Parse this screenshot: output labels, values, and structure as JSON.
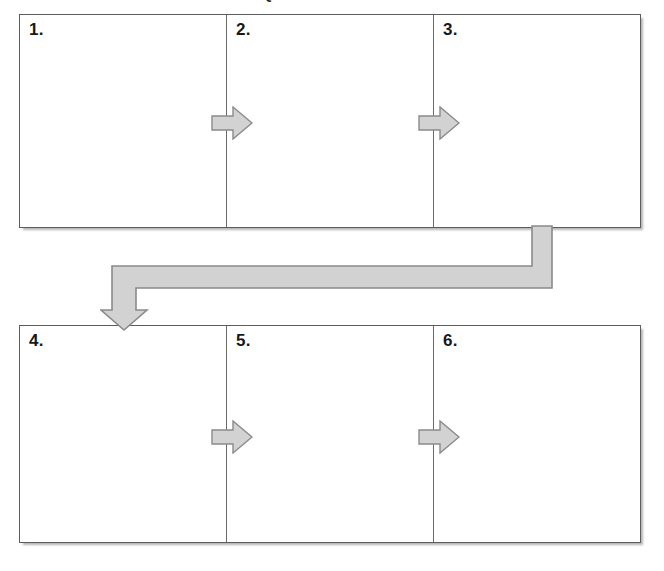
{
  "title": "SEQUENCE OF EVENTS",
  "colors": {
    "arrow_fill": "#d2d2d2",
    "arrow_stroke": "#8a8a8a",
    "box_border": "#5d5d5d",
    "divider": "#6a6a6a",
    "text": "#18181c",
    "background": "#ffffff"
  },
  "rows": [
    {
      "id": "row-top",
      "cells": [
        {
          "number": "1."
        },
        {
          "number": "2."
        },
        {
          "number": "3."
        }
      ]
    },
    {
      "id": "row-bottom",
      "cells": [
        {
          "number": "4."
        },
        {
          "number": "5."
        },
        {
          "number": "6."
        }
      ]
    }
  ],
  "arrows": [
    {
      "name": "arrow-1-2",
      "direction": "right",
      "from": "1",
      "to": "2"
    },
    {
      "name": "arrow-2-3",
      "direction": "right",
      "from": "2",
      "to": "3"
    },
    {
      "name": "arrow-4-5",
      "direction": "right",
      "from": "4",
      "to": "5"
    },
    {
      "name": "arrow-5-6",
      "direction": "right",
      "from": "5",
      "to": "6"
    },
    {
      "name": "connector-arrow",
      "direction": "elbow-down-left",
      "from": "3",
      "to": "4"
    }
  ]
}
